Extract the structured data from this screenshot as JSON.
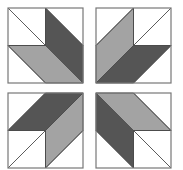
{
  "diagram": {
    "title": "",
    "colors": {
      "dark": "#555555",
      "light": "#a3a3a3",
      "white": "#ffffff",
      "line": "#4a4a4a",
      "border": "#777777"
    },
    "blocks": [
      {
        "id": "top-left",
        "x": 8,
        "y": 8,
        "size": 75,
        "transform": "none",
        "swap": false
      },
      {
        "id": "top-right",
        "x": 96,
        "y": 8,
        "size": 75,
        "transform": "mirror-x",
        "swap": true
      },
      {
        "id": "bottom-left",
        "x": 8,
        "y": 93,
        "size": 75,
        "transform": "mirror-y",
        "swap": true
      },
      {
        "id": "bottom-right",
        "x": 96,
        "y": 93,
        "size": 75,
        "transform": "rotate-180",
        "swap": false
      }
    ]
  }
}
